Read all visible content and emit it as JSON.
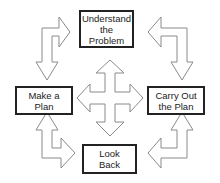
{
  "diagram": {
    "nodes": [
      {
        "id": "understand",
        "label": "Understand\nthe\nProblem"
      },
      {
        "id": "plan",
        "label": "Make a\nPlan"
      },
      {
        "id": "carry",
        "label": "Carry Out\nthe Plan"
      },
      {
        "id": "lookback",
        "label": "Look\nBack"
      }
    ],
    "edges": [
      {
        "from": "understand",
        "to": "plan",
        "style": "hollow-arrow"
      },
      {
        "from": "plan",
        "to": "understand",
        "style": "hollow-arrow"
      },
      {
        "from": "understand",
        "to": "carry",
        "style": "hollow-arrow"
      },
      {
        "from": "carry",
        "to": "understand",
        "style": "hollow-arrow"
      },
      {
        "from": "plan",
        "to": "lookback",
        "style": "hollow-arrow"
      },
      {
        "from": "lookback",
        "to": "plan",
        "style": "hollow-arrow"
      },
      {
        "from": "carry",
        "to": "lookback",
        "style": "hollow-arrow"
      },
      {
        "from": "lookback",
        "to": "carry",
        "style": "hollow-arrow"
      },
      {
        "from": "center",
        "to": "all",
        "style": "four-way-hollow-arrow"
      }
    ],
    "colors": {
      "stroke": "#222222",
      "arrow_stroke": "#888888",
      "fill": "#ffffff"
    }
  }
}
